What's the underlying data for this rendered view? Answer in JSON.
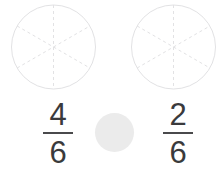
{
  "canvas": {
    "width": 218,
    "height": 170,
    "background_color": "#ffffff"
  },
  "activity": {
    "type": "fraction-comparison",
    "left_model": {
      "shape": "circle",
      "total_parts": 6,
      "shaded_parts": 0,
      "outline_color": "#e2e2e4",
      "divider_color": "#e2e2e4",
      "divider_style": "dashed"
    },
    "right_model": {
      "shape": "circle",
      "total_parts": 6,
      "shaded_parts": 0,
      "outline_color": "#e2e2e4",
      "divider_color": "#e2e2e4",
      "divider_style": "dashed"
    },
    "left_fraction": {
      "numerator": "4",
      "denominator": "6",
      "text_color": "#3a3a3c"
    },
    "right_fraction": {
      "numerator": "2",
      "denominator": "6",
      "text_color": "#3a3a3c"
    },
    "operator_slot": {
      "value": "",
      "fill_color": "#ebebeb"
    }
  }
}
